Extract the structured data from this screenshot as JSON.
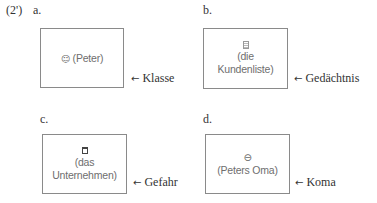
{
  "example_number": "(2')",
  "panels": [
    {
      "id": "a",
      "label": "a.",
      "icon": "smiley-face-icon",
      "icon_glyph": "☺",
      "box_lines": [
        "(Peter)"
      ],
      "inline_text": "(Peter)",
      "arrow": "←",
      "arrow_label": "Klasse"
    },
    {
      "id": "b",
      "label": "b.",
      "icon": "document-icon",
      "box_lines": [
        "(die",
        "Kundenliste)"
      ],
      "arrow": "←",
      "arrow_label": "Gedächtnis"
    },
    {
      "id": "c",
      "label": "c.",
      "icon": "building-square-icon",
      "box_lines": [
        "(das",
        "Unternehmen)"
      ],
      "arrow": "←",
      "arrow_label": "Gefahr"
    },
    {
      "id": "d",
      "label": "d.",
      "icon": "face-icon",
      "icon_glyph": "⊖",
      "box_lines": [
        "(Peters Oma)"
      ],
      "arrow": "←",
      "arrow_label": "Koma"
    }
  ]
}
